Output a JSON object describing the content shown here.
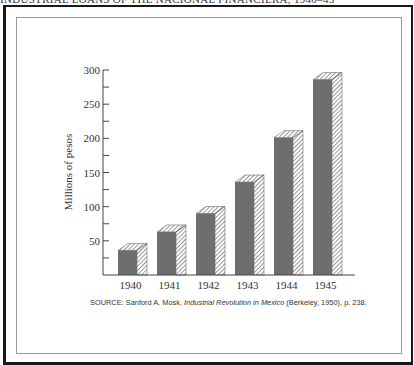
{
  "title": "INDUSTRIAL LOANS OF THE NACIONAL FINANCIERA, 1940–45",
  "source": {
    "prefix": "SOURCE: Sanford A. Mosk, ",
    "book": "Industrial Revolution in Mexico",
    "suffix": " (Berkeley, 1950), p. 238."
  },
  "colors": {
    "bar": "#6e6e6e",
    "hatch": "#444444",
    "axis": "#444444",
    "border": "#1a1a1a"
  },
  "chart_data": {
    "type": "bar",
    "title": "INDUSTRIAL LOANS OF THE NACIONAL FINANCIERA, 1940–45",
    "xlabel": "",
    "ylabel": "Millions of pesos",
    "categories": [
      "1940",
      "1941",
      "1942",
      "1943",
      "1944",
      "1945"
    ],
    "values": [
      36,
      63,
      90,
      136,
      201,
      286
    ],
    "ylim": [
      0,
      300
    ],
    "yticks": [
      50,
      100,
      150,
      200,
      250,
      300
    ],
    "minor_tick_step": 25,
    "grid": false,
    "legend": null,
    "style": "3D bars with hatched side faces"
  }
}
